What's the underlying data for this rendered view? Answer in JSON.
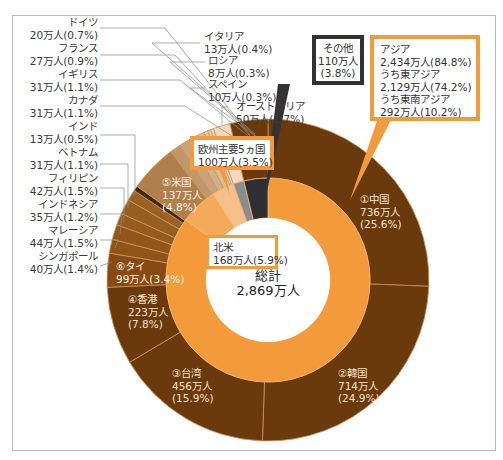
{
  "chart_data": {
    "type": "pie",
    "subtype": "nested-donut",
    "title": "",
    "unit": "万人",
    "total": {
      "label": "総計",
      "value": 2869,
      "value_text": "2,869万人"
    },
    "inner_ring": [
      {
        "name": "アジア",
        "value": 2434,
        "pct": 84.8,
        "color": "#f39a3b",
        "sub": [
          {
            "name": "うち東アジア",
            "value": 2129,
            "pct": 74.2
          },
          {
            "name": "うち東南アジア",
            "value": 292,
            "pct": 10.2
          }
        ]
      },
      {
        "name": "北米",
        "value": 168,
        "pct": 5.9,
        "color": "#f5a95a"
      },
      {
        "name": "欧州主要5ヵ国",
        "value": 100,
        "pct": 3.5,
        "color": "#f7c08a"
      },
      {
        "name": "オーストラリア",
        "value": 50,
        "pct": 1.7,
        "color": "#8a8d90"
      },
      {
        "name": "その他",
        "value": 110,
        "pct": 3.8,
        "color": "#2e2e33"
      }
    ],
    "outer_ring": [
      {
        "name": "中国",
        "rank": 1,
        "value": 736,
        "pct": 25.6,
        "color": "#6b3a0c"
      },
      {
        "name": "韓国",
        "rank": 2,
        "value": 714,
        "pct": 24.9,
        "color": "#6b3a0c"
      },
      {
        "name": "台湾",
        "rank": 3,
        "value": 456,
        "pct": 15.9,
        "color": "#6b3a0c"
      },
      {
        "name": "香港",
        "rank": 4,
        "value": 223,
        "pct": 7.8,
        "color": "#6b3a0c"
      },
      {
        "name": "タイ",
        "rank": 6,
        "value": 99,
        "pct": 3.4,
        "color": "#874a12"
      },
      {
        "name": "シンガポール",
        "value": 40,
        "pct": 1.4,
        "color": "#8f5416"
      },
      {
        "name": "マレーシア",
        "value": 44,
        "pct": 1.5,
        "color": "#92561a"
      },
      {
        "name": "インドネシア",
        "value": 35,
        "pct": 1.2,
        "color": "#955a1c"
      },
      {
        "name": "フィリピン",
        "value": 42,
        "pct": 1.5,
        "color": "#985d20"
      },
      {
        "name": "ベトナム",
        "value": 31,
        "pct": 1.1,
        "color": "#9b6124"
      },
      {
        "name": "インド",
        "value": 13,
        "pct": 0.5,
        "color": "#3e2a16"
      },
      {
        "name": "米国",
        "rank": 5,
        "value": 137,
        "pct": 4.8,
        "color": "#b07f4c"
      },
      {
        "name": "カナダ",
        "value": 31,
        "pct": 1.1,
        "color": "#c09768"
      },
      {
        "name": "イギリス",
        "value": 31,
        "pct": 1.1,
        "color": "#c9a47a"
      },
      {
        "name": "フランス",
        "value": 27,
        "pct": 0.9,
        "color": "#d2b08a"
      },
      {
        "name": "ドイツ",
        "value": 20,
        "pct": 0.7,
        "color": "#d9bc9a"
      },
      {
        "name": "イタリア",
        "value": 13,
        "pct": 0.4,
        "color": "#e0c6a8"
      },
      {
        "name": "ロシア",
        "value": 8,
        "pct": 0.3,
        "color": "#e6d0b6"
      },
      {
        "name": "スペイン",
        "value": 10,
        "pct": 0.3,
        "color": "#eddac4"
      },
      {
        "name": "オーストラリア",
        "value": 50,
        "pct": 1.7,
        "color": "#f2d9bd"
      },
      {
        "name": "その他",
        "value": 110,
        "pct": 3.8,
        "color": "#6b3a0c"
      }
    ],
    "legend_position": "callouts"
  },
  "labels": {
    "left": [
      {
        "name": "ドイツ",
        "value": "20万人(0.7%)"
      },
      {
        "name": "フランス",
        "value": "27万人(0.9%)"
      },
      {
        "name": "イギリス",
        "value": "31万人(1.1%)"
      },
      {
        "name": "カナダ",
        "value": "31万人(1.1%)"
      },
      {
        "name": "インド",
        "value": "13万人(0.5%)"
      },
      {
        "name": "ベトナム",
        "value": "31万人(1.1%)"
      },
      {
        "name": "フィリピン",
        "value": "42万人(1.5%)"
      },
      {
        "name": "インドネシア",
        "value": "35万人(1.2%)"
      },
      {
        "name": "マレーシア",
        "value": "44万人(1.5%)"
      },
      {
        "name": "シンガポール",
        "value": "40万人(1.4%)"
      }
    ],
    "top": [
      {
        "name": "イタリア",
        "value": "13万人(0.4%)"
      },
      {
        "name": "ロシア",
        "value": "8万人(0.3%)"
      },
      {
        "name": "スペイン",
        "value": "10万人(0.3%)"
      },
      {
        "name": "オーストラリア",
        "value": "50万人(1.7%)"
      }
    ],
    "boxes": {
      "other": "その他\n110万人\n(3.8%)",
      "asia": "アジア\n2,434万人(84.8%)\nうち東アジア\n2,129万人(74.2%)\nうち東南アジア\n292万人(10.2%)",
      "europe": "欧州主要5ヵ国\n100万人(3.5%)",
      "north_america": "北米\n168万人(5.9%)"
    },
    "inside": {
      "china": [
        "①中国",
        "736万人",
        "(25.6%)"
      ],
      "korea": [
        "②韓国",
        "714万人",
        "(24.9%)"
      ],
      "taiwan": [
        "③台湾",
        "456万人",
        "(15.9%)"
      ],
      "hongkong": [
        "④香港",
        "223万人",
        "(7.8%)"
      ],
      "usa": [
        "⑤米国",
        "137万人",
        "(4.8%)"
      ],
      "thailand": [
        "⑥タイ",
        "99万人(3.4%)"
      ]
    },
    "total_label": "総計",
    "total_value": "2,869万人"
  }
}
